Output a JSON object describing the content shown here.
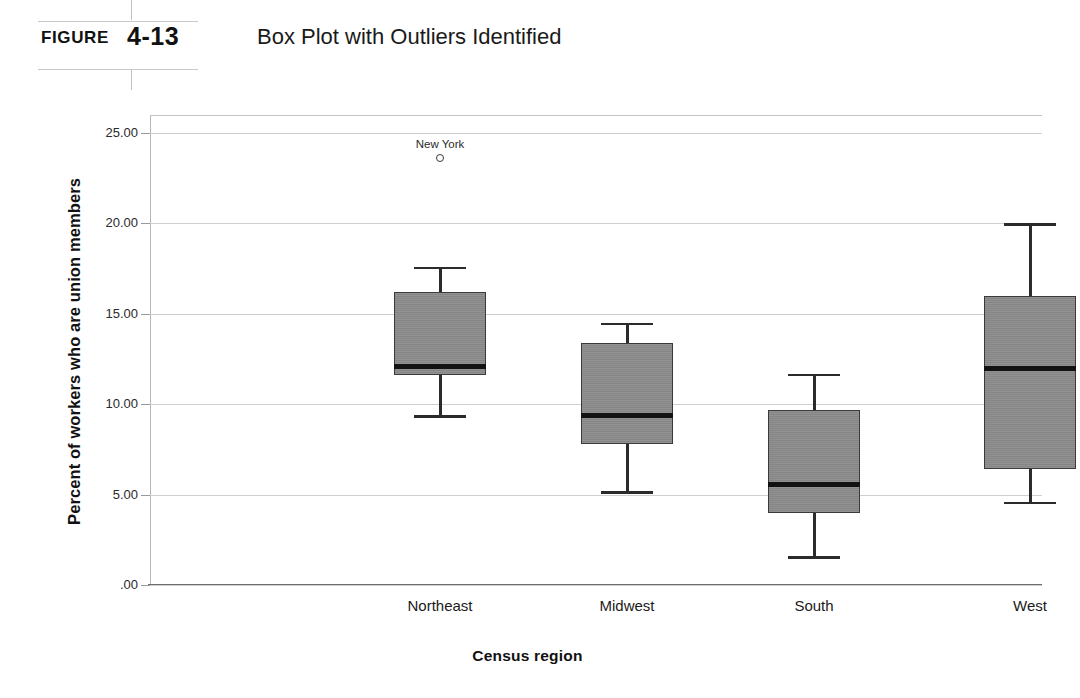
{
  "figure": {
    "label": "FIGURE",
    "number": "4-13",
    "title": "Box Plot with Outliers Identified"
  },
  "chart_data": {
    "type": "box",
    "title": "Box Plot with Outliers Identified",
    "xlabel": "Census region",
    "ylabel": "Percent of workers who are union members",
    "categories": [
      "Northeast",
      "Midwest",
      "South",
      "West"
    ],
    "ylim": [
      0,
      26
    ],
    "yticks": [
      0,
      5,
      10,
      15,
      20,
      25
    ],
    "ytick_labels": [
      ".00",
      "5.00",
      "10.00",
      "15.00",
      "20.00",
      "25.00"
    ],
    "grid": true,
    "legend": "none",
    "boxes": [
      {
        "category": "Northeast",
        "whisker_low": 9.4,
        "q1": 11.6,
        "median": 12.1,
        "q3": 16.2,
        "whisker_high": 17.6,
        "outliers": [
          {
            "label": "New York",
            "value": 23.6
          }
        ]
      },
      {
        "category": "Midwest",
        "whisker_low": 5.2,
        "q1": 7.8,
        "median": 9.4,
        "q3": 13.4,
        "whisker_high": 14.5,
        "outliers": []
      },
      {
        "category": "South",
        "whisker_low": 1.6,
        "q1": 4.0,
        "median": 5.6,
        "q3": 9.7,
        "whisker_high": 11.7,
        "outliers": []
      },
      {
        "category": "West",
        "whisker_low": 4.6,
        "q1": 6.4,
        "median": 12.0,
        "q3": 16.0,
        "whisker_high": 20.0,
        "outliers": []
      }
    ],
    "colors": {
      "box_fill": "#8c8c8c",
      "box_edge": "#3a3a3a",
      "median": "#121212",
      "whisker": "#2b2b2b",
      "gridline": "#cfcfcf",
      "axis": "#6e6e6e",
      "background": "#ffffff"
    }
  },
  "layout": {
    "plot_left": 150,
    "plot_width": 892,
    "plot_top": 25,
    "plot_height": 470,
    "box_width": 92,
    "category_centers": [
      290,
      477,
      664,
      880
    ]
  }
}
